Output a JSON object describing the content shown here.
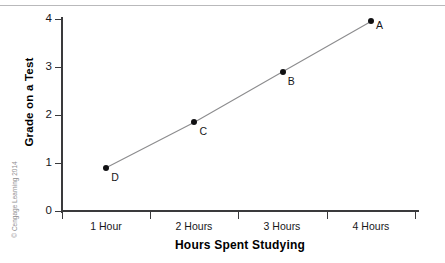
{
  "chart_data": {
    "type": "line",
    "title": "",
    "xlabel": "Hours Spent Studying",
    "ylabel": "Grade on a Test",
    "categories": [
      "1 Hour",
      "2 Hours",
      "3 Hours",
      "4 Hours"
    ],
    "x": [
      1,
      2,
      3,
      4
    ],
    "values": [
      0.9,
      1.85,
      2.9,
      3.95
    ],
    "point_labels": [
      "D",
      "C",
      "B",
      "A"
    ],
    "series": [
      {
        "name": "Grade vs Study Hours",
        "values": [
          0.9,
          1.85,
          2.9,
          3.95
        ],
        "point_labels": [
          "D",
          "C",
          "B",
          "A"
        ]
      }
    ],
    "points": [
      {
        "label": "D",
        "x_category": "1 Hour",
        "x": 1,
        "y": 0.9
      },
      {
        "label": "C",
        "x_category": "2 Hours",
        "x": 2,
        "y": 1.85
      },
      {
        "label": "B",
        "x_category": "3 Hours",
        "x": 3,
        "y": 2.9
      },
      {
        "label": "A",
        "x_category": "4 Hours",
        "x": 4,
        "y": 3.95
      }
    ],
    "ylim": [
      0,
      4
    ],
    "yticks": [
      0,
      1,
      2,
      3,
      4
    ],
    "ytick_labels": [
      "0",
      "1",
      "2",
      "3",
      "4"
    ],
    "xlim": [
      0.5,
      4.5
    ],
    "grid": false,
    "legend": false,
    "marker_color": "#111113",
    "line_color": "#8c8c8e",
    "axis_color": "#3a3a3c"
  },
  "axes": {
    "y_title": "Grade on a Test",
    "x_title": "Hours Spent Studying",
    "y_tick_labels": [
      "4",
      "3",
      "2",
      "1",
      "0"
    ],
    "x_tick_labels": [
      "1 Hour",
      "2 Hours",
      "3 Hours",
      "4 Hours"
    ]
  },
  "point_markers": {
    "a": "A",
    "b": "B",
    "c": "C",
    "d": "D"
  },
  "credit": {
    "text": "© Cengage Learning 2014"
  }
}
